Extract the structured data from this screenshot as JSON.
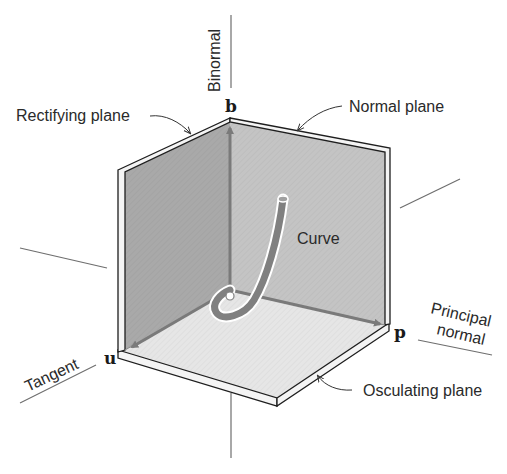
{
  "diagram": {
    "axes": {
      "binormal": "Binormal",
      "tangent": "Tangent",
      "principal_normal_line1": "Principal",
      "principal_normal_line2": "normal"
    },
    "vectors": {
      "b": "b",
      "u": "u",
      "p": "p"
    },
    "planes": {
      "rectifying": "Rectifying plane",
      "normal": "Normal plane",
      "osculating": "Osculating plane"
    },
    "curve_label": "Curve",
    "colors": {
      "rectifying_plane": "#a9a9a9",
      "normal_plane": "#c4c4c4",
      "osculating_plane": "#e6e6e6",
      "arrow": "#7a7a7a",
      "curve": "#808080",
      "line": "#6e6e6e"
    }
  }
}
